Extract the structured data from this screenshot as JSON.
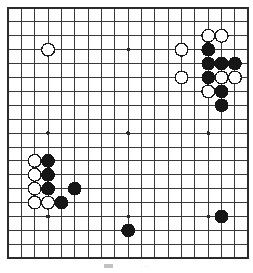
{
  "figure": {
    "kind": "go-board-diagram",
    "board_size": 19,
    "background_color": "#ffffff",
    "line_color": "#3a3a3a",
    "border_color": "#2b2b2b",
    "black_stone_color": "#161616",
    "white_stone_color": "#ffffff",
    "white_stone_edge_color": "#1a1a1a",
    "star_point_color": "#2b2b2b"
  },
  "geometry": {
    "origin_x": 6,
    "origin_y": 6,
    "step_x": 13.35,
    "step_y": 13.9,
    "stone_radius": 6.4,
    "star_radius": 1.9
  },
  "star_points": [
    {
      "col": 3,
      "row": 3
    },
    {
      "col": 9,
      "row": 3
    },
    {
      "col": 15,
      "row": 3
    },
    {
      "col": 3,
      "row": 9
    },
    {
      "col": 9,
      "row": 9
    },
    {
      "col": 15,
      "row": 9
    },
    {
      "col": 3,
      "row": 15
    },
    {
      "col": 9,
      "row": 15
    },
    {
      "col": 15,
      "row": 15
    }
  ],
  "stones": {
    "black": [
      {
        "col": 15,
        "row": 3
      },
      {
        "col": 15,
        "row": 4
      },
      {
        "col": 16,
        "row": 4
      },
      {
        "col": 17,
        "row": 4
      },
      {
        "col": 15,
        "row": 5
      },
      {
        "col": 16,
        "row": 6
      },
      {
        "col": 16,
        "row": 7
      },
      {
        "col": 3,
        "row": 11
      },
      {
        "col": 3,
        "row": 12
      },
      {
        "col": 3,
        "row": 13
      },
      {
        "col": 4,
        "row": 14
      },
      {
        "col": 5,
        "row": 13
      },
      {
        "col": 9,
        "row": 16
      },
      {
        "col": 16,
        "row": 15
      }
    ],
    "white": [
      {
        "col": 3,
        "row": 3
      },
      {
        "col": 13,
        "row": 3
      },
      {
        "col": 15,
        "row": 2
      },
      {
        "col": 16,
        "row": 2
      },
      {
        "col": 13,
        "row": 5
      },
      {
        "col": 17,
        "row": 5
      },
      {
        "col": 16,
        "row": 5
      },
      {
        "col": 15,
        "row": 6
      },
      {
        "col": 2,
        "row": 11
      },
      {
        "col": 2,
        "row": 12
      },
      {
        "col": 2,
        "row": 13
      },
      {
        "col": 2,
        "row": 14
      },
      {
        "col": 3,
        "row": 14
      }
    ]
  },
  "caption": {
    "left_mark": "",
    "right_mark": ""
  }
}
